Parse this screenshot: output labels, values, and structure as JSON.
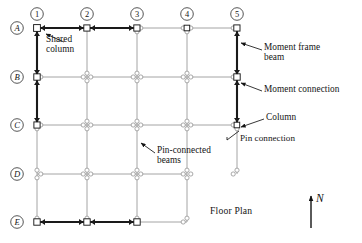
{
  "title": "Floor Plan",
  "diagram": {
    "caption": "Floor Plan",
    "north_label": "N",
    "column_grid_labels": [
      "1",
      "2",
      "3",
      "4",
      "5"
    ],
    "row_grid_labels": [
      "A",
      "B",
      "C",
      "D",
      "E"
    ],
    "column_grid_x": [
      37,
      87,
      137,
      187,
      237
    ],
    "row_grid_y": [
      28,
      77,
      125,
      174,
      222
    ],
    "colors": {
      "moment_frame": "#1a1a1a",
      "pin_beam": "#9a9a9a",
      "annotation": "#141414",
      "background": "#ffffff",
      "marker_fill": "#ffffff"
    },
    "moment_frames": [
      {
        "name": "row-A-1-to-3",
        "from": "1-A",
        "to": "3-A",
        "orientation": "horizontal"
      },
      {
        "name": "row-E-1-to-3",
        "from": "1-E",
        "to": "3-E",
        "orientation": "horizontal"
      },
      {
        "name": "line-1-A-to-C",
        "from": "1-A",
        "to": "1-C",
        "orientation": "vertical"
      },
      {
        "name": "line-5-A-to-C",
        "from": "5-A",
        "to": "5-C",
        "orientation": "vertical"
      }
    ],
    "moment_connection_nodes": [
      "1-A",
      "2-A",
      "3-A",
      "1-B",
      "1-C",
      "5-A",
      "5-B",
      "5-C",
      "1-E",
      "2-E",
      "3-E"
    ],
    "annotations": [
      {
        "id": "shared-column",
        "text": "Shared\ncolumn",
        "x": 46,
        "y": 39,
        "align": "left"
      },
      {
        "id": "moment-frame-beam",
        "text": "Moment frame\nbeam",
        "x": 264,
        "y": 47,
        "align": "left"
      },
      {
        "id": "moment-connection",
        "text": "Moment connection",
        "x": 264,
        "y": 88,
        "align": "left"
      },
      {
        "id": "column",
        "text": "Column",
        "x": 266,
        "y": 116,
        "align": "left"
      },
      {
        "id": "pin-connection",
        "text": "Pin connection",
        "x": 229,
        "y": 137,
        "align": "left"
      },
      {
        "id": "pin-connected-beams",
        "text": "Pin-connected\nbeams",
        "x": 157,
        "y": 150,
        "align": "left"
      }
    ]
  }
}
